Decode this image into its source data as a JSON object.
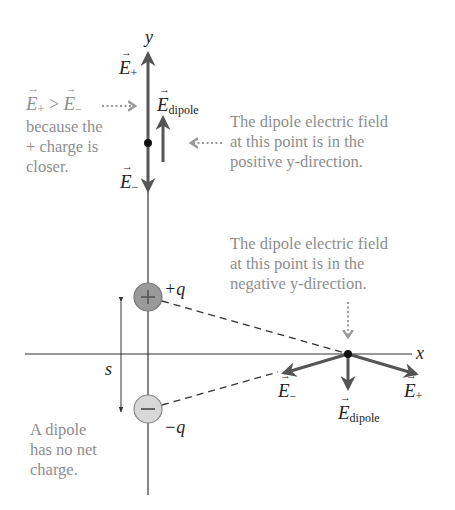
{
  "diagram": {
    "axes": {
      "x_label": "x",
      "y_label": "y"
    },
    "charges": {
      "positive": {
        "symbol": "+",
        "label": "+q",
        "fill": "#9a9a9a"
      },
      "negative": {
        "symbol": "−",
        "label": "−q",
        "fill": "#d8d8d8"
      }
    },
    "separation_label": "s",
    "vectors": {
      "e_plus": "E",
      "e_plus_sub": "+",
      "e_minus": "E",
      "e_minus_sub": "−",
      "e_dipole": "E",
      "e_dipole_sub": "dipole"
    },
    "annotations": {
      "comparison_lhs": "E",
      "comparison_lhs_sub": "+",
      "comparison_op": " > ",
      "comparison_rhs": "E",
      "comparison_rhs_sub": "−",
      "comparison_lines": [
        "because the",
        "+ charge is",
        "closer."
      ],
      "top_point_note": [
        "The dipole electric field",
        "at this point is in the",
        "positive y-direction."
      ],
      "right_point_note": [
        "The dipole electric field",
        "at this point is in the",
        "negative y-direction."
      ],
      "net_charge_note": [
        "A dipole",
        "has no net",
        "charge."
      ]
    },
    "colors": {
      "axis": "#333333",
      "vector": "#555555",
      "annotation_text": "#8e8e8e",
      "label_text": "#222222"
    }
  }
}
